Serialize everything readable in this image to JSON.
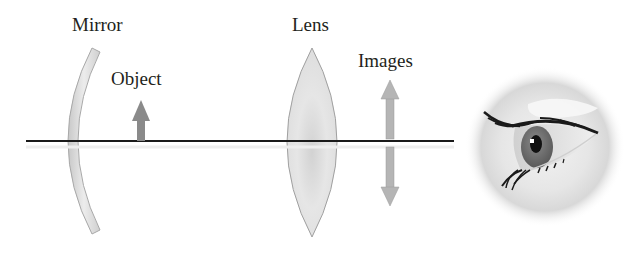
{
  "diagram": {
    "labels": {
      "mirror": "Mirror",
      "object": "Object",
      "lens": "Lens",
      "images": "Images"
    },
    "elements": [
      {
        "id": "optical-axis",
        "type": "line",
        "from": [
          26,
          141
        ],
        "to": [
          454,
          141
        ]
      },
      {
        "id": "mirror",
        "type": "concave-mirror",
        "top": [
          96,
          50
        ],
        "bottom": [
          96,
          232
        ],
        "vertex_x": 60
      },
      {
        "id": "object-arrow",
        "type": "arrow",
        "direction": "up",
        "x": 141,
        "from_y": 141,
        "to_y": 100
      },
      {
        "id": "lens",
        "type": "biconvex-lens",
        "center_x": 312,
        "top_y": 48,
        "bottom_y": 237,
        "half_width": 26
      },
      {
        "id": "image-arrow-upright",
        "type": "arrow",
        "direction": "up",
        "x": 390,
        "from_y": 139,
        "to_y": 80
      },
      {
        "id": "image-arrow-inverted",
        "type": "arrow",
        "direction": "down",
        "x": 390,
        "from_y": 147,
        "to_y": 206
      },
      {
        "id": "eye",
        "type": "illustration",
        "center": [
          545,
          147
        ],
        "radius": 78
      }
    ],
    "colors": {
      "axis": "#1a1a1a",
      "mirror_fill": "#d9d9d9",
      "mirror_stroke": "#a8a8a8",
      "lens_fill": "#e4e4e4",
      "lens_stroke": "#a0a0a0",
      "object_arrow": "#8a8a8a",
      "image_arrow": "#b5b5b5",
      "text": "#231f20"
    }
  }
}
